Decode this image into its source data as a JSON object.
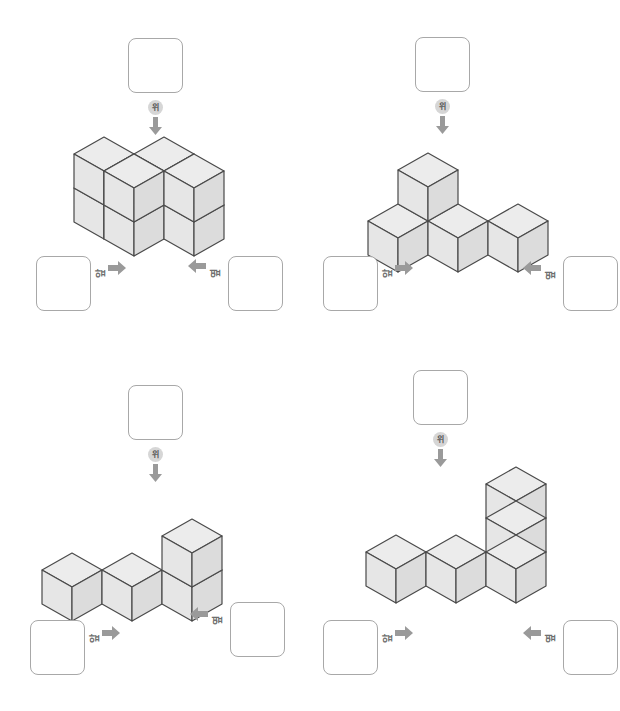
{
  "page": {
    "background": "#ffffff",
    "width": 620,
    "height": 711
  },
  "style": {
    "cube_top_color": "#ececec",
    "cube_left_color": "#e6e6e6",
    "cube_right_color": "#dcdcdc",
    "cube_stroke": "#4a4a4a",
    "box_border": "#a8a8a8",
    "label_color": "#6e6e6e",
    "arrow_color": "#9a9a9a",
    "label_badge_bg": "#d6d6d6"
  },
  "labels": {
    "top": "위",
    "front": "앞",
    "side": "옆"
  },
  "icons": {
    "arrow_down": "arrow-down-icon",
    "arrow_right": "arrow-right-icon",
    "arrow_left": "arrow-left-icon"
  },
  "figures": [
    {
      "id": "figure-1",
      "name": "two-by-two-by-two-cube",
      "answer_boxes": {
        "top": "",
        "front": "",
        "side": ""
      },
      "cube_count": 8,
      "cells": [
        [
          0,
          0,
          0
        ],
        [
          1,
          0,
          0
        ],
        [
          0,
          1,
          0
        ],
        [
          1,
          1,
          0
        ],
        [
          0,
          0,
          1
        ],
        [
          1,
          0,
          1
        ],
        [
          0,
          1,
          1
        ],
        [
          1,
          1,
          1
        ]
      ]
    },
    {
      "id": "figure-2",
      "name": "row-of-three-with-one-on-middle",
      "answer_boxes": {
        "top": "",
        "front": "",
        "side": ""
      },
      "cube_count": 4,
      "cells": [
        [
          0,
          0,
          0
        ],
        [
          1,
          0,
          0
        ],
        [
          2,
          0,
          0
        ],
        [
          0,
          0,
          1
        ]
      ]
    },
    {
      "id": "figure-3",
      "name": "row-of-three-with-one-on-right-end",
      "answer_boxes": {
        "top": "",
        "front": "",
        "side": ""
      },
      "cube_count": 4,
      "cells": [
        [
          0,
          0,
          0
        ],
        [
          1,
          0,
          0
        ],
        [
          2,
          0,
          0
        ],
        [
          2,
          0,
          1
        ]
      ]
    },
    {
      "id": "figure-4",
      "name": "row-of-three-with-two-tall-tower-on-right",
      "answer_boxes": {
        "top": "",
        "front": "",
        "side": ""
      },
      "cube_count": 5,
      "cells": [
        [
          0,
          0,
          0
        ],
        [
          1,
          0,
          0
        ],
        [
          2,
          0,
          0
        ],
        [
          2,
          0,
          1
        ],
        [
          2,
          0,
          2
        ]
      ]
    }
  ]
}
